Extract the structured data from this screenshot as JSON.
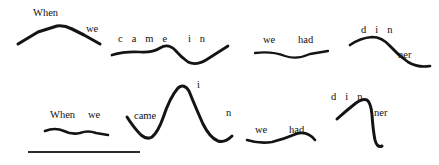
{
  "figure": {
    "background_color": "#ffffff",
    "ink_color": "#141414",
    "width": 439,
    "height": 165
  },
  "rows": [
    {
      "name": "top-row",
      "description": "First rendition of the utterance",
      "phrases": [
        {
          "id": "top-when-we",
          "labels": [
            {
              "text": "When",
              "x": 33,
              "y": 8,
              "spaced": false
            },
            {
              "text": "we",
              "x": 86,
              "y": 24,
              "spaced": false
            }
          ],
          "path": "M 18 44 L 38 32 L 57 26 Q 64 25 72 29 L 84 35 L 100 44"
        },
        {
          "id": "top-came-in",
          "labels": [
            {
              "text": "c a m e   i n",
              "x": 118,
              "y": 34,
              "spaced": true
            }
          ],
          "path": "M 112 55 Q 125 51 140 52 Q 152 53 160 48 Q 168 43 175 50 Q 181 57 188 62 Q 196 66 206 60 Q 217 53 228 46"
        },
        {
          "id": "top-we-had",
          "labels": [
            {
              "text": "we",
              "x": 263,
              "y": 35,
              "spaced": false
            },
            {
              "text": "had",
              "x": 298,
              "y": 35,
              "spaced": false
            }
          ],
          "path": "M 255 53 Q 272 51 285 56 Q 297 60 310 54 L 328 51"
        },
        {
          "id": "top-dinner",
          "labels": [
            {
              "text": "d i n",
              "x": 361,
              "y": 25,
              "spaced": true
            },
            {
              "text": "ner",
              "x": 398,
              "y": 50,
              "spaced": false
            }
          ],
          "path": "M 350 45 Q 360 38 372 37 Q 382 37 390 46 Q 398 55 408 62 Q 418 68 430 66"
        }
      ]
    },
    {
      "name": "bottom-row",
      "description": "Second rendition of the utterance",
      "phrases": [
        {
          "id": "bottom-when-we",
          "labels": [
            {
              "text": "When",
              "x": 50,
              "y": 110,
              "spaced": false
            },
            {
              "text": "we",
              "x": 88,
              "y": 110,
              "spaced": false
            }
          ],
          "path": "M 45 131 Q 55 127 64 131 Q 72 135 80 133 Q 88 130 96 133 L 108 135"
        },
        {
          "id": "bottom-came-in",
          "labels": [
            {
              "text": "came",
              "x": 134,
              "y": 111,
              "spaced": false
            },
            {
              "text": "i",
              "x": 197,
              "y": 80,
              "spaced": false
            },
            {
              "text": "n",
              "x": 226,
              "y": 108,
              "spaced": false
            }
          ],
          "path": "M 127 117 Q 134 128 141 135 Q 147 140 152 137 Q 158 132 163 118 Q 170 97 178 88 Q 184 83 189 91 Q 195 106 203 124 Q 210 138 218 141 Q 225 143 232 136"
        },
        {
          "id": "bottom-we-had",
          "labels": [
            {
              "text": "we",
              "x": 255,
              "y": 125,
              "spaced": false
            },
            {
              "text": "had",
              "x": 289,
              "y": 125,
              "spaced": false
            }
          ],
          "path": "M 247 140 Q 260 144 272 142 Q 284 139 296 134 Q 307 130 315 140"
        },
        {
          "id": "bottom-dinner",
          "labels": [
            {
              "text": "d i n",
              "x": 331,
              "y": 92,
              "spaced": true
            },
            {
              "text": "ner",
              "x": 374,
              "y": 108,
              "spaced": false
            }
          ],
          "path": "M 337 119 Q 347 110 356 103 Q 363 98 367 100 Q 371 103 372 115 Q 373 130 375 140 Q 377 148 382 146"
        }
      ]
    }
  ],
  "scale_bar": {
    "name": "scale-bar",
    "x1": 28,
    "y1": 152,
    "x2": 140,
    "y2": 152
  }
}
